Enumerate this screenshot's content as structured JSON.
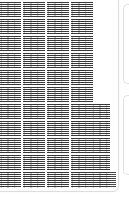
{
  "view": {
    "kind": "document-page-thumbnail",
    "width": 129,
    "height": 198,
    "background_color": "#ffffff",
    "page_border_color": "#dcdcdc",
    "text_ink_color": "#282828"
  },
  "page": {
    "name": "page-thumbnail",
    "corner_radius": 6,
    "columns_visible": 6,
    "rows_visible": 11
  },
  "neighbors": [
    {
      "name": "neighbor-page-top",
      "edge": "right",
      "top": 4,
      "height": 80
    },
    {
      "name": "neighbor-page-bottom",
      "edge": "right",
      "top": 95,
      "height": 80
    }
  ],
  "grid": {
    "rows": [
      {
        "top": 2,
        "height": 15
      },
      {
        "top": 19,
        "height": 15
      },
      {
        "top": 36,
        "height": 15
      },
      {
        "top": 53,
        "height": 15
      },
      {
        "top": 70,
        "height": 15
      },
      {
        "top": 87,
        "height": 15
      },
      {
        "top": 104,
        "height": 15
      },
      {
        "top": 121,
        "height": 15
      },
      {
        "top": 138,
        "height": 15
      },
      {
        "top": 155,
        "height": 15
      },
      {
        "top": 172,
        "height": 16
      }
    ],
    "columns": [
      {
        "left": 0,
        "width": 21
      },
      {
        "left": 23,
        "width": 22
      },
      {
        "left": 47,
        "width": 22
      },
      {
        "left": 71,
        "width": 22
      },
      {
        "left": 92,
        "width": 18
      },
      {
        "left": 110,
        "width": 6
      }
    ],
    "cells": [
      {
        "row": 0,
        "col": 0
      },
      {
        "row": 0,
        "col": 1
      },
      {
        "row": 0,
        "col": 2
      },
      {
        "row": 0,
        "col": 3
      },
      {
        "row": 1,
        "col": 0
      },
      {
        "row": 1,
        "col": 1
      },
      {
        "row": 1,
        "col": 2
      },
      {
        "row": 1,
        "col": 3
      },
      {
        "row": 2,
        "col": 0
      },
      {
        "row": 2,
        "col": 1
      },
      {
        "row": 2,
        "col": 2
      },
      {
        "row": 2,
        "col": 3
      },
      {
        "row": 3,
        "col": 0
      },
      {
        "row": 3,
        "col": 1
      },
      {
        "row": 3,
        "col": 2
      },
      {
        "row": 3,
        "col": 3
      },
      {
        "row": 4,
        "col": 0
      },
      {
        "row": 4,
        "col": 1
      },
      {
        "row": 4,
        "col": 2
      },
      {
        "row": 4,
        "col": 3
      },
      {
        "row": 5,
        "col": 0
      },
      {
        "row": 5,
        "col": 1
      },
      {
        "row": 5,
        "col": 2
      },
      {
        "row": 5,
        "col": 3
      },
      {
        "row": 6,
        "col": 0
      },
      {
        "row": 6,
        "col": 1
      },
      {
        "row": 6,
        "col": 2
      },
      {
        "row": 6,
        "col": 3
      },
      {
        "row": 6,
        "col": 4
      },
      {
        "row": 7,
        "col": 0
      },
      {
        "row": 7,
        "col": 1
      },
      {
        "row": 7,
        "col": 2
      },
      {
        "row": 7,
        "col": 3
      },
      {
        "row": 7,
        "col": 4
      },
      {
        "row": 8,
        "col": 0
      },
      {
        "row": 8,
        "col": 1
      },
      {
        "row": 8,
        "col": 2
      },
      {
        "row": 8,
        "col": 3
      },
      {
        "row": 8,
        "col": 4
      },
      {
        "row": 9,
        "col": 0
      },
      {
        "row": 9,
        "col": 1
      },
      {
        "row": 9,
        "col": 2
      },
      {
        "row": 9,
        "col": 3
      },
      {
        "row": 9,
        "col": 4
      },
      {
        "row": 10,
        "col": 0
      },
      {
        "row": 10,
        "col": 1
      },
      {
        "row": 10,
        "col": 2
      },
      {
        "row": 10,
        "col": 3
      },
      {
        "row": 10,
        "col": 4
      },
      {
        "row": 10,
        "col": 5,
        "style": "sparse"
      }
    ]
  }
}
